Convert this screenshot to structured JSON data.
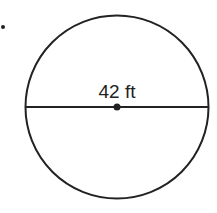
{
  "diagram": {
    "shape": "circle",
    "diameter_label": "42 ft",
    "colors": {
      "stroke": "#222222",
      "background": "#ffffff"
    }
  }
}
